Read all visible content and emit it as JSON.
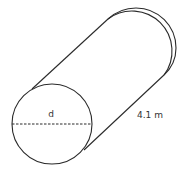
{
  "diagram": {
    "type": "cylinder",
    "labels": {
      "diameter": "d",
      "length": "4.1 m"
    },
    "colors": {
      "stroke": "#2a2a2a",
      "background": "#ffffff",
      "text": "#333333"
    }
  }
}
